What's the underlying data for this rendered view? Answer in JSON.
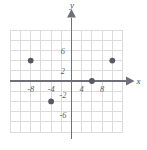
{
  "figure": {
    "title": "",
    "background_color": "#ffffff",
    "grid_color": "#d8d8dc",
    "axis_color": "#6f6f77",
    "point_color": "#595963",
    "tick_text_color": "#5c5c66"
  },
  "axis_names": {
    "x": "x",
    "y": "y"
  },
  "ticks": {
    "x_negative": [
      "-8",
      "-4"
    ],
    "x_positive": [
      "4",
      "8"
    ],
    "y_positive": [
      "6",
      "2"
    ],
    "y_negative": [
      "-2",
      "-6"
    ]
  },
  "chart_data": {
    "type": "scatter",
    "title": "",
    "xlabel": "x",
    "ylabel": "y",
    "xlim": [
      -12,
      12
    ],
    "ylim": [
      -8,
      8
    ],
    "grid": true,
    "grid_spacing": 2,
    "legend": "none",
    "xticks": [
      -8,
      -4,
      4,
      8
    ],
    "xtick_labels": [
      "-8",
      "-4",
      "4",
      "8"
    ],
    "yticks": [
      6,
      2,
      -2,
      -6
    ],
    "ytick_labels": [
      "6",
      "2",
      "-2",
      "-6"
    ],
    "series": [
      {
        "name": "points",
        "marker": "filled-circle",
        "color": "#595963",
        "points": [
          {
            "x": -8,
            "y": 4,
            "label": "(-8, 4)"
          },
          {
            "x": 8,
            "y": 4,
            "label": "(8, 4)"
          },
          {
            "x": 4,
            "y": 0,
            "label": "(4, 0)"
          },
          {
            "x": -4,
            "y": -4,
            "label": "(-4, -4)"
          }
        ]
      }
    ]
  }
}
